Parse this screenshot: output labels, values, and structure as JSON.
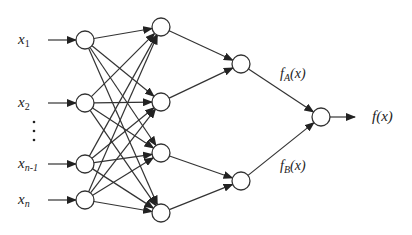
{
  "diagram": {
    "type": "neural-network",
    "inputs": [
      {
        "id": "x1",
        "base": "x",
        "sub": "1",
        "y": 40
      },
      {
        "id": "x2",
        "base": "x",
        "sub": "2",
        "y": 103
      },
      {
        "id": "xn-1",
        "base": "x",
        "sub": "n-1",
        "y": 164
      },
      {
        "id": "xn",
        "base": "x",
        "sub": "n",
        "y": 200
      }
    ],
    "ellipsis": "⋮",
    "layers": {
      "input": {
        "x": 85,
        "ys": [
          40,
          103,
          164,
          200
        ]
      },
      "hidden1": {
        "x": 161,
        "ys": [
          27,
          102,
          153,
          213
        ]
      },
      "hidden2": {
        "x": 241,
        "ys": [
          64,
          181
        ]
      },
      "output": {
        "x": 321,
        "ys": [
          117
        ]
      }
    },
    "branch_labels": {
      "upper": {
        "base": "f",
        "sub": "A",
        "arg": "(x)"
      },
      "lower": {
        "base": "f",
        "sub": "B",
        "arg": "(x)"
      }
    },
    "output_label": "f(x)"
  }
}
